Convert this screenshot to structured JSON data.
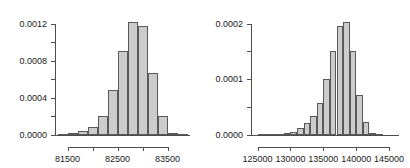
{
  "figure": {
    "kind": "two-panel-histogram-figure",
    "background": "#ffffff",
    "bar_fill": "#cccccc",
    "bar_border": "#595959",
    "axis_color": "#4d4d4d"
  },
  "chart_data": [
    {
      "type": "bar",
      "title": "",
      "xlabel": "",
      "ylabel": "",
      "grid": false,
      "legend": null,
      "xlim": [
        81250,
        83950
      ],
      "ylim": [
        0,
        0.00126
      ],
      "ytick_labels": [
        "0.0000",
        "0.0004",
        "0.0008",
        "0.0012"
      ],
      "ytick_values": [
        0.0,
        0.0004,
        0.0008,
        0.0012
      ],
      "yminor_values": [
        0.0002,
        0.0006,
        0.001
      ],
      "xtick_labels": [
        "81500",
        "82500",
        "83500"
      ],
      "xtick_values": [
        81500,
        82500,
        83500
      ],
      "xminor_values": [
        82000,
        83000
      ],
      "bin_width": 200,
      "bin_edges": [
        81300,
        81500,
        81700,
        81900,
        82100,
        82300,
        82500,
        82700,
        82900,
        83100,
        83300,
        83500,
        83700,
        83900
      ],
      "bin_centers": [
        81400,
        81600,
        81800,
        82000,
        82200,
        82400,
        82600,
        82800,
        83000,
        83200,
        83400,
        83600,
        83800
      ],
      "values": [
        0.0,
        2e-05,
        4e-05,
        9e-05,
        0.00021,
        0.00049,
        0.0009,
        0.00122,
        0.00117,
        0.00067,
        0.00021,
        2e-05,
        0.0
      ]
    },
    {
      "type": "bar",
      "title": "",
      "xlabel": "",
      "ylabel": "",
      "grid": false,
      "legend": null,
      "xlim": [
        124000,
        146500
      ],
      "ylim": [
        0,
        0.00021
      ],
      "ytick_labels": [
        "0.0000",
        "0.0001",
        "0.0002"
      ],
      "ytick_values": [
        0.0,
        0.0001,
        0.0002
      ],
      "yminor_values": [
        5e-05,
        0.00015
      ],
      "xtick_labels": [
        "125000",
        "130000",
        "135000",
        "140000",
        "145000"
      ],
      "xtick_values": [
        125000,
        130000,
        135000,
        140000,
        145000
      ],
      "xminor_values": [],
      "bin_width": 1000,
      "bin_edges": [
        125000,
        126000,
        127000,
        128000,
        129000,
        130000,
        131000,
        132000,
        133000,
        134000,
        135000,
        136000,
        137000,
        138000,
        139000,
        140000,
        141000,
        142000,
        143000,
        144000
      ],
      "bin_centers": [
        125500,
        126500,
        127500,
        128500,
        129500,
        130500,
        131500,
        132500,
        133500,
        134500,
        135500,
        136500,
        137500,
        138500,
        139500,
        140500,
        141500,
        142500,
        143500
      ],
      "values": [
        0.0,
        0.0,
        0.0,
        2e-06,
        4e-06,
        6e-06,
        1.2e-05,
        2.2e-05,
        3.5e-05,
        5.7e-05,
        0.0001,
        0.000151,
        0.000195,
        0.000202,
        0.00015,
        7.2e-05,
        2.3e-05,
        3e-06,
        0.0
      ]
    }
  ]
}
